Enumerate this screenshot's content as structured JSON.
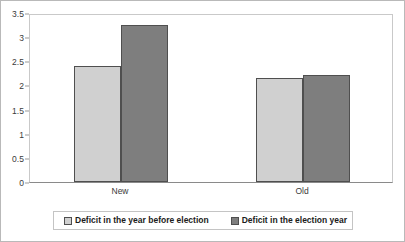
{
  "chart_data": {
    "type": "bar",
    "title": "",
    "xlabel": "",
    "ylabel": "",
    "categories": [
      "New",
      "Old"
    ],
    "series": [
      {
        "name": "Deficit in the year before election",
        "values": [
          2.4,
          2.15
        ],
        "color": "#d0d0d0"
      },
      {
        "name": "Deficit in the election year",
        "values": [
          3.25,
          2.22
        ],
        "color": "#7e7e7e"
      }
    ],
    "ylim": [
      0,
      3.5
    ],
    "ytick_values": [
      0,
      0.5,
      1,
      1.5,
      2,
      2.5,
      3,
      3.5
    ],
    "ytick_labels": [
      "0",
      "0.5",
      "1",
      "1.5",
      "2",
      "2.5",
      "3",
      "3.5"
    ],
    "grid": false,
    "legend_position": "bottom"
  },
  "legend": {
    "items": [
      {
        "label": "Deficit in the year before election",
        "swatch": "#d0d0d0"
      },
      {
        "label": "Deficit in the election year",
        "swatch": "#7e7e7e"
      }
    ]
  },
  "colors": {
    "series_light": "#d0d0d0",
    "series_dark": "#7e7e7e",
    "bar_outline": "#4f4f4f",
    "axis": "#8a8a8a",
    "text": "#3a3a3a",
    "frame": "#b9b9b9"
  }
}
